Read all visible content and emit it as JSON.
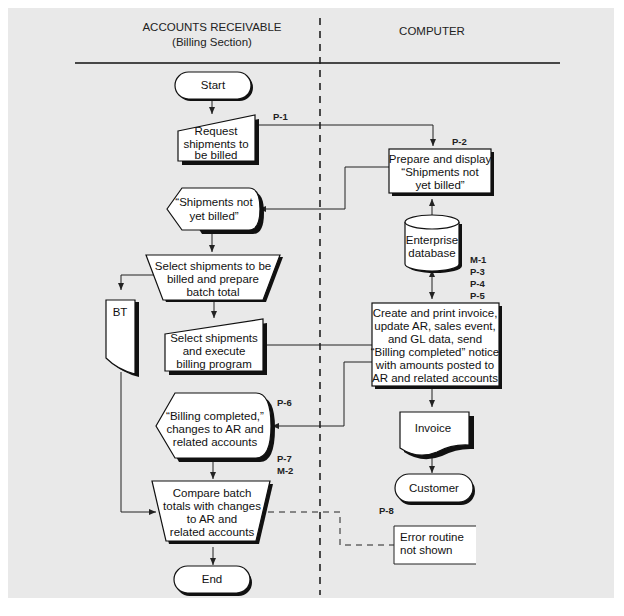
{
  "swimlanes": {
    "left": {
      "title": "ACCOUNTS RECEIVABLE",
      "subtitle": "(Billing Section)"
    },
    "right": {
      "title": "COMPUTER"
    }
  },
  "nodes": {
    "start": {
      "type": "terminal",
      "label": "Start"
    },
    "request": {
      "type": "manual-input",
      "lines": [
        "Request",
        "shipments to",
        "be billed"
      ]
    },
    "prepare_display": {
      "type": "process",
      "lines": [
        "Prepare and display",
        "“Shipments not",
        "yet billed”"
      ]
    },
    "display_not_billed": {
      "type": "display",
      "lines": [
        "“Shipments not",
        "yet billed”"
      ]
    },
    "database": {
      "type": "disk",
      "lines": [
        "Enterprise",
        "database"
      ]
    },
    "select_prepare": {
      "type": "manual-operation",
      "lines": [
        "Select shipments to be",
        "billed and prepare",
        "batch total"
      ]
    },
    "bt": {
      "type": "document",
      "label": "BT"
    },
    "select_execute": {
      "type": "manual-input",
      "lines": [
        "Select shipments",
        "and execute",
        "billing program"
      ]
    },
    "create_invoice": {
      "type": "process",
      "lines": [
        "Create and print invoice,",
        "update AR, sales event,",
        "and GL data, send",
        "“Billing completed” notice",
        "with amounts posted to",
        "AR and related accounts"
      ]
    },
    "display_billing_completed": {
      "type": "display",
      "lines": [
        "“Billing completed,”",
        "changes to AR and",
        "related accounts"
      ]
    },
    "invoice": {
      "type": "document",
      "label": "Invoice"
    },
    "customer": {
      "type": "terminal",
      "label": "Customer"
    },
    "compare": {
      "type": "manual-operation",
      "lines": [
        "Compare batch",
        "totals with changes",
        "to AR and",
        "related accounts"
      ]
    },
    "error_routine": {
      "type": "annotation",
      "lines": [
        "Error routine",
        "not shown"
      ]
    },
    "end": {
      "type": "terminal",
      "label": "End"
    }
  },
  "labels": {
    "p1": "P-1",
    "p2": "P-2",
    "m1": "M-1",
    "p3": "P-3",
    "p4": "P-4",
    "p5": "P-5",
    "p6": "P-6",
    "p7": "P-7",
    "m2": "M-2",
    "p8": "P-8"
  },
  "colors": {
    "panel_background": "#e9e9e9",
    "shape_fill": "#ffffff",
    "line": "#111111"
  }
}
